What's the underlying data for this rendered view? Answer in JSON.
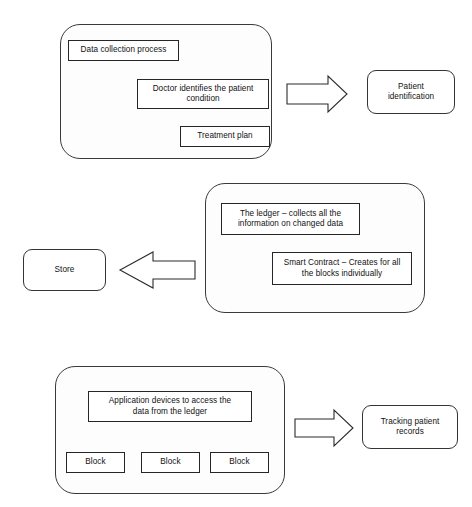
{
  "diagram": {
    "type": "flowchart",
    "background_color": "#ffffff",
    "stroke_color": "#2b2b2b",
    "panel_fill": "#fdfdfd",
    "rows": [
      {
        "id": "row-data-collection",
        "panel": {
          "name": "data-collection-panel",
          "x": 60,
          "y": 24,
          "w": 212,
          "h": 135
        },
        "nodes": [
          {
            "id": "data-collection-process",
            "label": "Data collection process",
            "shape": "rect",
            "x": 68,
            "y": 40,
            "w": 111,
            "h": 21
          },
          {
            "id": "doctor-identifies-condition",
            "label": "Doctor identifies the patient\ncondition",
            "shape": "rect",
            "x": 137,
            "y": 79,
            "w": 132,
            "h": 30
          },
          {
            "id": "treatment-plan",
            "label": "Treatment plan",
            "shape": "rect",
            "x": 180,
            "y": 126,
            "w": 90,
            "h": 21
          }
        ],
        "arrow": {
          "name": "row1-block-arrow",
          "direction": "right",
          "x": 287,
          "y": 76,
          "w": 60,
          "h": 36
        },
        "outcome": {
          "id": "patient-identification",
          "label": "Patient\nidentification",
          "shape": "rounded-rect",
          "x": 367,
          "y": 70,
          "w": 88,
          "h": 44
        }
      },
      {
        "id": "row-ledger",
        "panel": {
          "name": "ledger-panel",
          "x": 205,
          "y": 183,
          "w": 220,
          "h": 130
        },
        "nodes": [
          {
            "id": "the-ledger",
            "label": "The ledger – collects all the\ninformation on changed data",
            "shape": "rect",
            "x": 221,
            "y": 203,
            "w": 139,
            "h": 32
          },
          {
            "id": "smart-contract",
            "label": "Smart Contract – Creates for all\nthe blocks individually",
            "shape": "rect",
            "x": 272,
            "y": 252,
            "w": 140,
            "h": 33
          }
        ],
        "arrow": {
          "name": "row2-block-arrow",
          "direction": "left",
          "x": 120,
          "y": 252,
          "w": 75,
          "h": 36
        },
        "outcome": {
          "id": "store",
          "label": "Store",
          "shape": "rounded-rect",
          "x": 23,
          "y": 249,
          "w": 83,
          "h": 42
        }
      },
      {
        "id": "row-application",
        "panel": {
          "name": "application-panel",
          "x": 55,
          "y": 366,
          "w": 230,
          "h": 128
        },
        "nodes": [
          {
            "id": "application-devices",
            "label": "Application devices to access the\ndata from the ledger",
            "shape": "rect",
            "x": 88,
            "y": 391,
            "w": 164,
            "h": 31
          },
          {
            "id": "block-1",
            "label": "Block",
            "shape": "rect",
            "x": 66,
            "y": 452,
            "w": 59,
            "h": 21
          },
          {
            "id": "block-2",
            "label": "Block",
            "shape": "rect",
            "x": 141,
            "y": 452,
            "w": 59,
            "h": 21
          },
          {
            "id": "block-3",
            "label": "Block",
            "shape": "rect",
            "x": 210,
            "y": 452,
            "w": 59,
            "h": 21
          }
        ],
        "arrow": {
          "name": "row3-block-arrow",
          "direction": "right",
          "x": 295,
          "y": 410,
          "w": 58,
          "h": 35
        },
        "outcome": {
          "id": "tracking-patient-records",
          "label": "Tracking patient\nrecords",
          "shape": "rounded-rect",
          "x": 362,
          "y": 405,
          "w": 96,
          "h": 44
        }
      }
    ]
  }
}
